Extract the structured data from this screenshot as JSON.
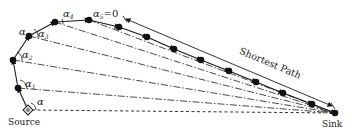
{
  "labels": {
    "source": "Source",
    "sink": "Sink",
    "shortest_path": "Shortest Path",
    "alpha": "α",
    "alpha_top": "α",
    "alpha_1": "1",
    "alpha_2": "2",
    "alpha_3": "3",
    "alpha_4": "4",
    "alpha_5": "5",
    "alpha_5_eq": "=0"
  },
  "nodes": [
    {
      "id": "source",
      "x": 28,
      "y": 110,
      "shape": "diamond"
    },
    {
      "id": "n1",
      "x": 18,
      "y": 88
    },
    {
      "id": "n2",
      "x": 13,
      "y": 60
    },
    {
      "id": "n3",
      "x": 29,
      "y": 36
    },
    {
      "id": "n4",
      "x": 55,
      "y": 22
    },
    {
      "id": "n5",
      "x": 89,
      "y": 20
    },
    {
      "id": "n6",
      "x": 119,
      "y": 27
    },
    {
      "id": "n7",
      "x": 147,
      "y": 37
    },
    {
      "id": "n8",
      "x": 174,
      "y": 49
    },
    {
      "id": "n9",
      "x": 201,
      "y": 60
    },
    {
      "id": "n10",
      "x": 229,
      "y": 71
    },
    {
      "id": "n11",
      "x": 256,
      "y": 82
    },
    {
      "id": "n12",
      "x": 283,
      "y": 93
    },
    {
      "id": "n13",
      "x": 312,
      "y": 104
    },
    {
      "id": "sink",
      "x": 335,
      "y": 113
    }
  ],
  "colors": {
    "ink": "#1a1a1a",
    "background": "#ffffff"
  }
}
